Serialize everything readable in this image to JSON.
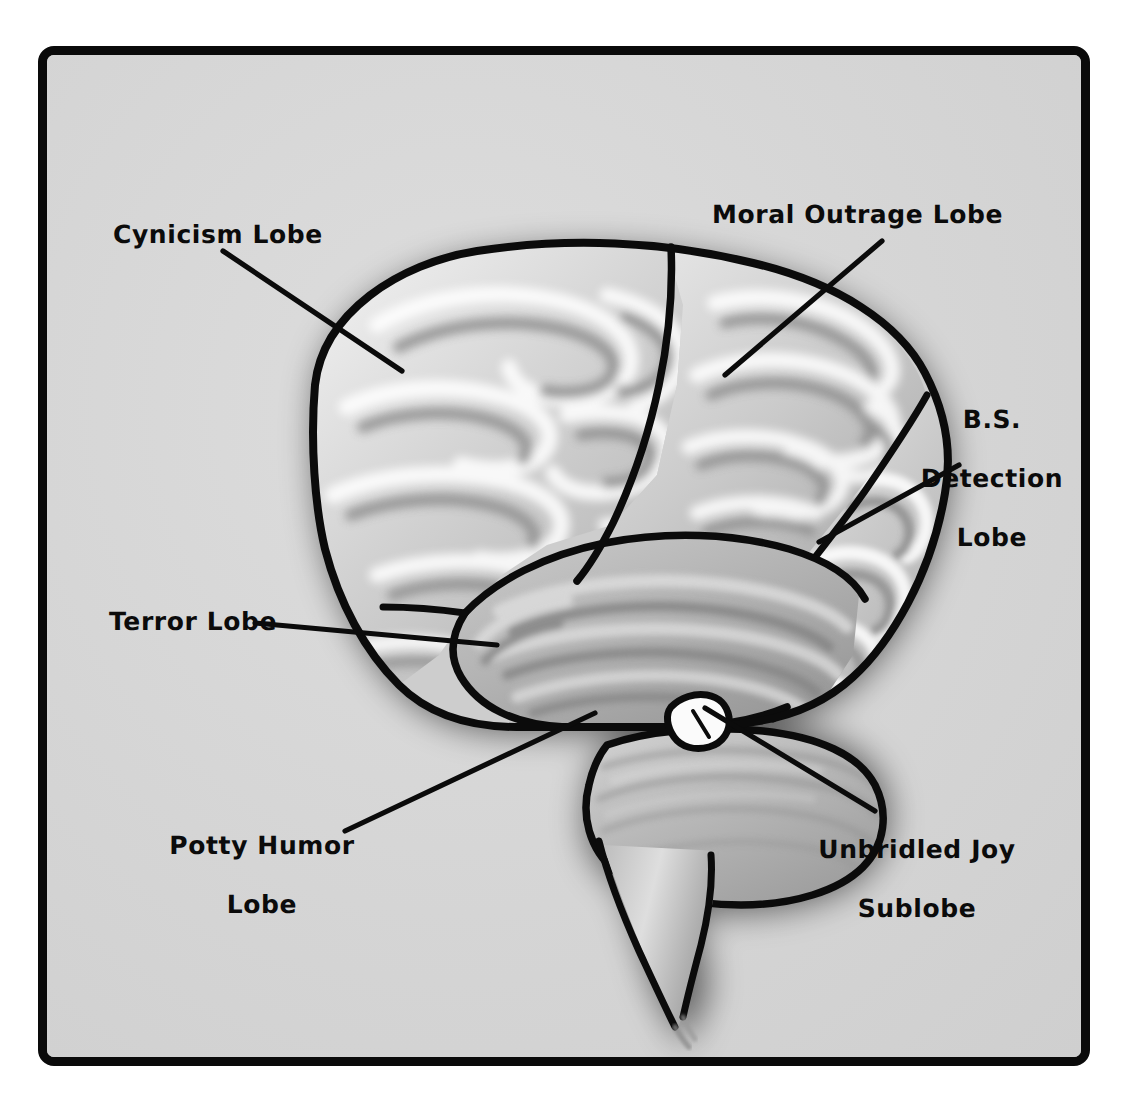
{
  "figure": {
    "type": "anatomical-diagram",
    "style": "hand-drawn grayscale cartoon with drop shadow",
    "frame": {
      "border_color": "#0a0a0a",
      "panel_color": "#d7d7d7",
      "page_color": "#ffffff"
    }
  },
  "palette": {
    "ink": "#0b0b0b",
    "panel": "#d7d7d7",
    "cortex_light": "#e8e8e8",
    "cortex_mid": "#b9b9b9",
    "cortex_dark": "#8e8e8e",
    "sulcus": "#9a9a9a",
    "highlight": "#ffffff",
    "shadow": "#8a8a8a"
  },
  "labels": [
    {
      "id": "cynicism",
      "text": "Cynicism Lobe",
      "lines": [
        "Cynicism Lobe"
      ],
      "align": "left",
      "region": "frontal lobe"
    },
    {
      "id": "moral-outrage",
      "text": "Moral Outrage Lobe",
      "lines": [
        "Moral Outrage Lobe"
      ],
      "align": "left",
      "region": "parietal lobe"
    },
    {
      "id": "bs-detection",
      "text": "B.S. Detection Lobe",
      "lines": [
        "B.S.",
        "Detection",
        "Lobe"
      ],
      "align": "center",
      "region": "occipital lobe"
    },
    {
      "id": "terror",
      "text": "Terror Lobe",
      "lines": [
        "Terror Lobe"
      ],
      "align": "left",
      "region": "temporal lobe"
    },
    {
      "id": "potty-humor",
      "text": "Potty Humor Lobe",
      "lines": [
        "Potty Humor",
        "Lobe"
      ],
      "align": "center",
      "region": "cerebellum"
    },
    {
      "id": "unbridled-joy",
      "text": "Unbridled Joy Sublobe",
      "lines": [
        "Unbridled Joy",
        "Sublobe"
      ],
      "align": "center",
      "region": "tiny white nodule near brainstem"
    }
  ],
  "parts": [
    {
      "id": "frontal",
      "name": "Cynicism Lobe"
    },
    {
      "id": "parietal",
      "name": "Moral Outrage Lobe"
    },
    {
      "id": "occipital",
      "name": "B.S. Detection Lobe"
    },
    {
      "id": "temporal",
      "name": "Terror Lobe"
    },
    {
      "id": "cerebellum",
      "name": "Potty Humor Lobe"
    },
    {
      "id": "nodule",
      "name": "Unbridled Joy Sublobe"
    },
    {
      "id": "brainstem",
      "name": "brain stem"
    }
  ]
}
